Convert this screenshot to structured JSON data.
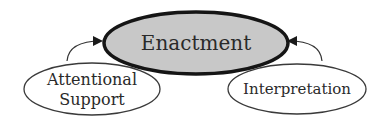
{
  "diagram": {
    "center": {
      "label": "Enactment",
      "fill": "#c8c8c8",
      "stroke": "#151515"
    },
    "left": {
      "lines": [
        "Attentional",
        "Support"
      ],
      "fill": "#ffffff",
      "stroke": "#3a3a3a"
    },
    "right": {
      "label": "Interpretation",
      "fill": "#ffffff",
      "stroke": "#3a3a3a"
    },
    "arrows": [
      {
        "from": "Attentional Support",
        "to": "Enactment"
      },
      {
        "from": "Interpretation",
        "to": "Enactment"
      }
    ]
  }
}
